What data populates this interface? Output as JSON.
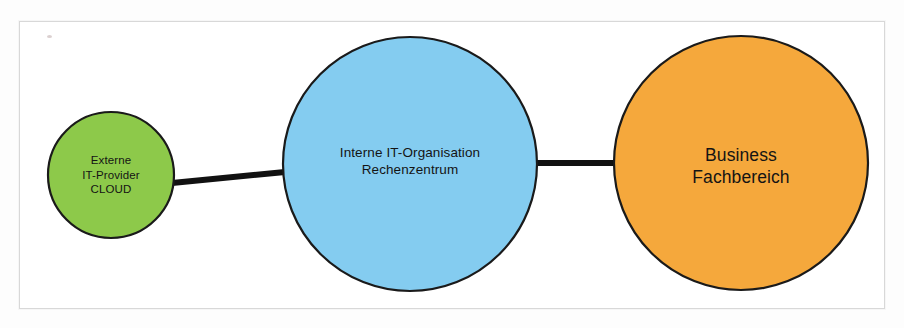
{
  "diagram": {
    "type": "node-link",
    "background_color": "#ffffff",
    "frame_border_color": "#d8d8d8",
    "edge_color": "#111111",
    "node_outline_color": "#1a1a1a",
    "nodes": [
      {
        "id": "external",
        "name": "external-it-provider",
        "fill": "#8DC94A",
        "cx": 111,
        "cy": 175,
        "r": 63,
        "lines": [
          "Externe",
          "IT-Provider",
          "CLOUD"
        ]
      },
      {
        "id": "internal",
        "name": "internal-it-organisation",
        "fill": "#84CCF0",
        "cx": 410,
        "cy": 164,
        "r": 127,
        "lines": [
          "Interne IT-Organisation",
          "Rechenzentrum"
        ]
      },
      {
        "id": "business",
        "name": "business-department",
        "fill": "#F5A83C",
        "cx": 741,
        "cy": 163,
        "r": 127,
        "lines": [
          "Business",
          "Fachbereich"
        ]
      }
    ],
    "edges": [
      {
        "id": "edge-external-internal",
        "from": "external",
        "to": "internal",
        "x1": 172,
        "y1": 183,
        "x2": 285,
        "y2": 172,
        "width": 6
      },
      {
        "id": "edge-internal-business",
        "from": "internal",
        "to": "business",
        "x1": 533,
        "y1": 163,
        "x2": 617,
        "y2": 163,
        "width": 6
      }
    ]
  }
}
